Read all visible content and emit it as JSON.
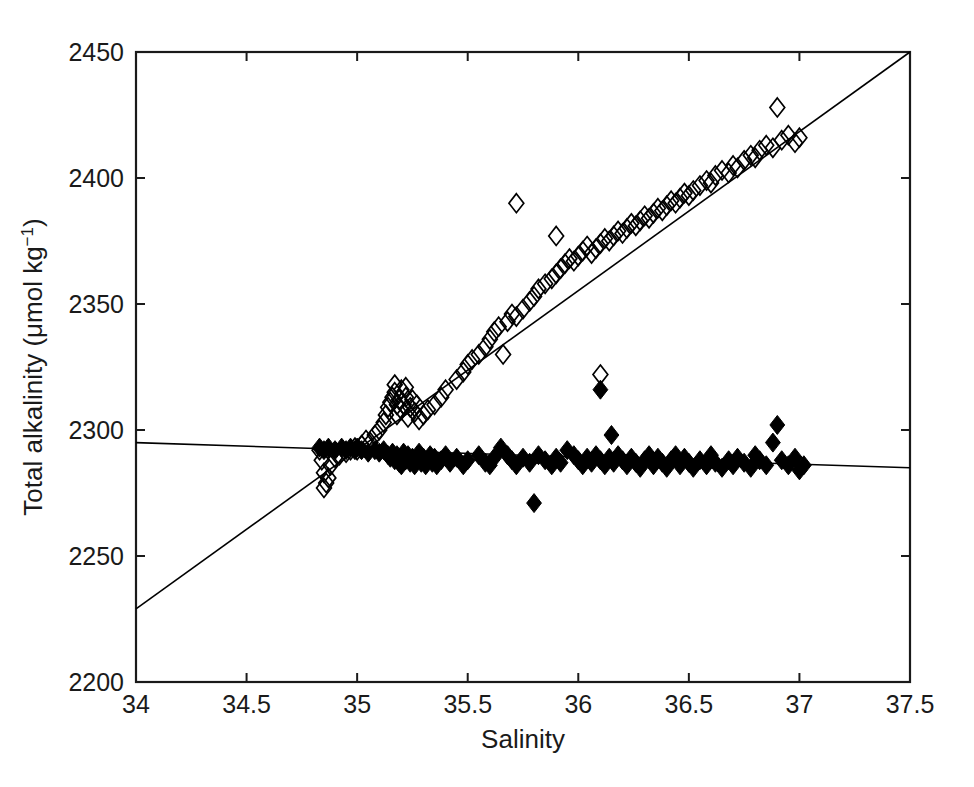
{
  "chart_data": {
    "type": "scatter",
    "title": "",
    "xlabel": "Salinity",
    "ylabel": "Total alkalinity (μmol kg⁻¹)",
    "ylabel_main": "Total alkalinity (μmol kg",
    "ylabel_sup": "−1",
    "ylabel_tail": ")",
    "xlim": [
      34,
      37.5
    ],
    "ylim": [
      2200,
      2450
    ],
    "xticks": [
      34,
      34.5,
      35,
      35.5,
      36,
      36.5,
      37,
      37.5
    ],
    "xticklabels": [
      "34",
      "34.5",
      "35",
      "35.5",
      "36",
      "36.5",
      "37",
      "37.5"
    ],
    "yticks": [
      2200,
      2250,
      2300,
      2350,
      2400,
      2450
    ],
    "yticklabels": [
      "2200",
      "2250",
      "2300",
      "2350",
      "2400",
      "2450"
    ],
    "grid": false,
    "legend": "none",
    "marker_color": "#000000",
    "line_color": "#000000",
    "series": [
      {
        "name": "open-diamonds",
        "marker": "diamond-open",
        "points": [
          [
            34.83,
            2292
          ],
          [
            34.84,
            2288
          ],
          [
            34.85,
            2283
          ],
          [
            34.85,
            2277
          ],
          [
            34.86,
            2279
          ],
          [
            34.87,
            2281
          ],
          [
            34.88,
            2286
          ],
          [
            34.9,
            2289
          ],
          [
            34.92,
            2290
          ],
          [
            34.95,
            2291
          ],
          [
            34.97,
            2292
          ],
          [
            34.99,
            2293
          ],
          [
            35.0,
            2292
          ],
          [
            35.02,
            2294
          ],
          [
            35.04,
            2296
          ],
          [
            35.06,
            2295
          ],
          [
            35.08,
            2298
          ],
          [
            35.1,
            2300
          ],
          [
            35.12,
            2303
          ],
          [
            35.13,
            2306
          ],
          [
            35.14,
            2309
          ],
          [
            35.15,
            2311
          ],
          [
            35.16,
            2313
          ],
          [
            35.17,
            2315
          ],
          [
            35.17,
            2318
          ],
          [
            35.18,
            2310
          ],
          [
            35.18,
            2306
          ],
          [
            35.19,
            2312
          ],
          [
            35.2,
            2316
          ],
          [
            35.2,
            2308
          ],
          [
            35.21,
            2310
          ],
          [
            35.22,
            2313
          ],
          [
            35.22,
            2317
          ],
          [
            35.23,
            2305
          ],
          [
            35.24,
            2309
          ],
          [
            35.25,
            2312
          ],
          [
            35.26,
            2307
          ],
          [
            35.27,
            2310
          ],
          [
            35.28,
            2304
          ],
          [
            35.3,
            2306
          ],
          [
            35.32,
            2308
          ],
          [
            35.35,
            2310
          ],
          [
            35.38,
            2313
          ],
          [
            35.4,
            2316
          ],
          [
            35.45,
            2320
          ],
          [
            35.48,
            2323
          ],
          [
            35.5,
            2326
          ],
          [
            35.52,
            2328
          ],
          [
            35.55,
            2330
          ],
          [
            35.58,
            2333
          ],
          [
            35.6,
            2336
          ],
          [
            35.62,
            2339
          ],
          [
            35.64,
            2341
          ],
          [
            35.66,
            2330
          ],
          [
            35.68,
            2343
          ],
          [
            35.7,
            2346
          ],
          [
            35.72,
            2345
          ],
          [
            35.75,
            2348
          ],
          [
            35.78,
            2351
          ],
          [
            35.72,
            2390
          ],
          [
            35.8,
            2353
          ],
          [
            35.82,
            2356
          ],
          [
            35.85,
            2358
          ],
          [
            35.88,
            2360
          ],
          [
            35.9,
            2362
          ],
          [
            35.9,
            2377
          ],
          [
            35.92,
            2364
          ],
          [
            35.94,
            2366
          ],
          [
            35.96,
            2368
          ],
          [
            35.98,
            2367
          ],
          [
            36.0,
            2369
          ],
          [
            36.02,
            2371
          ],
          [
            36.04,
            2373
          ],
          [
            36.06,
            2370
          ],
          [
            36.08,
            2372
          ],
          [
            36.1,
            2374
          ],
          [
            36.1,
            2322
          ],
          [
            36.12,
            2376
          ],
          [
            36.14,
            2375
          ],
          [
            36.16,
            2377
          ],
          [
            36.18,
            2379
          ],
          [
            36.2,
            2378
          ],
          [
            36.22,
            2380
          ],
          [
            36.24,
            2382
          ],
          [
            36.26,
            2381
          ],
          [
            36.28,
            2383
          ],
          [
            36.3,
            2385
          ],
          [
            36.32,
            2384
          ],
          [
            36.34,
            2386
          ],
          [
            36.36,
            2388
          ],
          [
            36.38,
            2387
          ],
          [
            36.4,
            2389
          ],
          [
            36.42,
            2391
          ],
          [
            36.44,
            2390
          ],
          [
            36.46,
            2392
          ],
          [
            36.48,
            2394
          ],
          [
            36.5,
            2393
          ],
          [
            36.52,
            2395
          ],
          [
            36.55,
            2397
          ],
          [
            36.58,
            2399
          ],
          [
            36.6,
            2398
          ],
          [
            36.62,
            2401
          ],
          [
            36.65,
            2403
          ],
          [
            36.68,
            2402
          ],
          [
            36.7,
            2405
          ],
          [
            36.72,
            2404
          ],
          [
            36.75,
            2407
          ],
          [
            36.78,
            2409
          ],
          [
            36.8,
            2408
          ],
          [
            36.82,
            2411
          ],
          [
            36.85,
            2413
          ],
          [
            36.88,
            2412
          ],
          [
            36.9,
            2428
          ],
          [
            36.92,
            2415
          ],
          [
            36.95,
            2417
          ],
          [
            36.98,
            2414
          ],
          [
            37.0,
            2416
          ]
        ]
      },
      {
        "name": "filled-diamonds",
        "marker": "diamond-filled",
        "points": [
          [
            34.83,
            2293
          ],
          [
            34.85,
            2292
          ],
          [
            34.87,
            2293
          ],
          [
            34.9,
            2292
          ],
          [
            34.93,
            2293
          ],
          [
            34.95,
            2292
          ],
          [
            34.97,
            2293
          ],
          [
            34.99,
            2292
          ],
          [
            35.0,
            2293
          ],
          [
            35.02,
            2292
          ],
          [
            35.05,
            2291
          ],
          [
            35.08,
            2292
          ],
          [
            35.1,
            2291
          ],
          [
            35.12,
            2292
          ],
          [
            35.14,
            2290
          ],
          [
            35.15,
            2289
          ],
          [
            35.16,
            2291
          ],
          [
            35.17,
            2288
          ],
          [
            35.18,
            2290
          ],
          [
            35.19,
            2287
          ],
          [
            35.2,
            2289
          ],
          [
            35.2,
            2286
          ],
          [
            35.21,
            2291
          ],
          [
            35.22,
            2288
          ],
          [
            35.23,
            2290
          ],
          [
            35.24,
            2287
          ],
          [
            35.25,
            2289
          ],
          [
            35.26,
            2286
          ],
          [
            35.27,
            2288
          ],
          [
            35.28,
            2291
          ],
          [
            35.29,
            2287
          ],
          [
            35.3,
            2289
          ],
          [
            35.31,
            2286
          ],
          [
            35.32,
            2288
          ],
          [
            35.33,
            2290
          ],
          [
            35.34,
            2287
          ],
          [
            35.35,
            2289
          ],
          [
            35.36,
            2286
          ],
          [
            35.38,
            2288
          ],
          [
            35.4,
            2290
          ],
          [
            35.42,
            2287
          ],
          [
            35.45,
            2289
          ],
          [
            35.48,
            2286
          ],
          [
            35.5,
            2288
          ],
          [
            35.55,
            2290
          ],
          [
            35.58,
            2287
          ],
          [
            35.6,
            2286
          ],
          [
            35.62,
            2289
          ],
          [
            35.65,
            2293
          ],
          [
            35.68,
            2290
          ],
          [
            35.7,
            2288
          ],
          [
            35.72,
            2286
          ],
          [
            35.75,
            2289
          ],
          [
            35.78,
            2287
          ],
          [
            35.8,
            2271
          ],
          [
            35.82,
            2290
          ],
          [
            35.85,
            2288
          ],
          [
            35.88,
            2286
          ],
          [
            35.9,
            2289
          ],
          [
            35.92,
            2287
          ],
          [
            35.95,
            2292
          ],
          [
            35.98,
            2290
          ],
          [
            36.0,
            2288
          ],
          [
            36.02,
            2286
          ],
          [
            36.04,
            2289
          ],
          [
            36.06,
            2287
          ],
          [
            36.08,
            2290
          ],
          [
            36.1,
            2288
          ],
          [
            36.1,
            2316
          ],
          [
            36.12,
            2286
          ],
          [
            36.14,
            2289
          ],
          [
            36.15,
            2298
          ],
          [
            36.16,
            2287
          ],
          [
            36.18,
            2290
          ],
          [
            36.2,
            2288
          ],
          [
            36.22,
            2286
          ],
          [
            36.24,
            2289
          ],
          [
            36.26,
            2287
          ],
          [
            36.28,
            2285
          ],
          [
            36.3,
            2288
          ],
          [
            36.32,
            2290
          ],
          [
            36.34,
            2286
          ],
          [
            36.36,
            2289
          ],
          [
            36.38,
            2287
          ],
          [
            36.4,
            2285
          ],
          [
            36.42,
            2288
          ],
          [
            36.44,
            2290
          ],
          [
            36.46,
            2286
          ],
          [
            36.48,
            2289
          ],
          [
            36.5,
            2287
          ],
          [
            36.52,
            2285
          ],
          [
            36.55,
            2288
          ],
          [
            36.58,
            2286
          ],
          [
            36.6,
            2290
          ],
          [
            36.62,
            2287
          ],
          [
            36.65,
            2285
          ],
          [
            36.68,
            2288
          ],
          [
            36.7,
            2286
          ],
          [
            36.72,
            2289
          ],
          [
            36.75,
            2287
          ],
          [
            36.78,
            2285
          ],
          [
            36.8,
            2290
          ],
          [
            36.82,
            2288
          ],
          [
            36.85,
            2286
          ],
          [
            36.88,
            2295
          ],
          [
            36.9,
            2302
          ],
          [
            36.92,
            2288
          ],
          [
            36.95,
            2286
          ],
          [
            36.98,
            2289
          ],
          [
            37.0,
            2284
          ],
          [
            37.02,
            2286
          ]
        ]
      }
    ],
    "fit_lines": [
      {
        "name": "rising-fit",
        "x": [
          34,
          37.5
        ],
        "y": [
          2229,
          2450
        ]
      },
      {
        "name": "flat-fit",
        "x": [
          34,
          37.5
        ],
        "y": [
          2295,
          2285
        ]
      }
    ]
  },
  "figure": {
    "background": "#ffffff",
    "axis_color": "#1a1a1a"
  }
}
